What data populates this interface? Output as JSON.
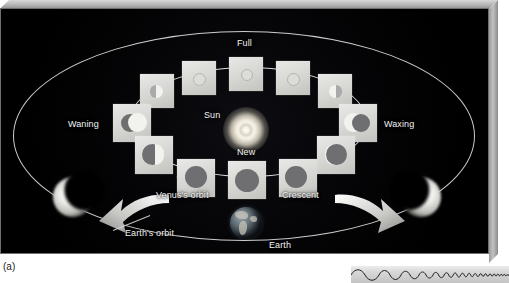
{
  "figure": {
    "caption": "(a)",
    "labels": {
      "full": "Full",
      "sun": "Sun",
      "new": "New",
      "waning": "Waning",
      "waxing": "Waxing",
      "venus_orbit": "Venus's orbit",
      "crescent": "Crescent",
      "earth_orbit": "Earth's orbit",
      "earth": "Earth"
    },
    "colors": {
      "background": "#030305",
      "orbit_line": "#dcdcdc",
      "tile_face": "#d5d5d2",
      "venus_shadow": "#6f6f72",
      "venus_lit": "#f2f2ef",
      "label_text": "#f3f3f3",
      "frame_bevel": "#b4b4b4",
      "caption_text": "#1b1b1b",
      "wave_band": "#d6d6d6"
    },
    "venus_phases": [
      {
        "name": "full",
        "illumination": 1.0,
        "position": "top-center"
      },
      {
        "name": "gibbous-waning",
        "illumination": 0.85,
        "position": "top-left-inner"
      },
      {
        "name": "gibbous-waxing",
        "illumination": 0.85,
        "position": "top-right-inner"
      },
      {
        "name": "quarter-waning",
        "illumination": 0.55,
        "position": "upper-left"
      },
      {
        "name": "quarter-waxing",
        "illumination": 0.55,
        "position": "upper-right"
      },
      {
        "name": "half-waning",
        "illumination": 0.45,
        "position": "left"
      },
      {
        "name": "half-waxing",
        "illumination": 0.45,
        "position": "right"
      },
      {
        "name": "crescent-waning",
        "illumination": 0.22,
        "position": "lower-left"
      },
      {
        "name": "crescent-waxing",
        "illumination": 0.22,
        "position": "lower-right"
      },
      {
        "name": "new-left",
        "illumination": 0.05,
        "position": "bottom-left"
      },
      {
        "name": "new",
        "illumination": 0.0,
        "position": "bottom-center"
      },
      {
        "name": "new-right",
        "illumination": 0.05,
        "position": "bottom-right"
      }
    ],
    "icons": {
      "sun": "sun-glow-icon",
      "earth": "earth-globe-icon",
      "venus_crescent_left": "venus-crescent-icon",
      "venus_crescent_right": "venus-crescent-icon",
      "arrow_left": "curved-arrow-left-icon",
      "arrow_right": "curved-arrow-right-icon",
      "waveform": "chirp-waveform-icon"
    }
  }
}
